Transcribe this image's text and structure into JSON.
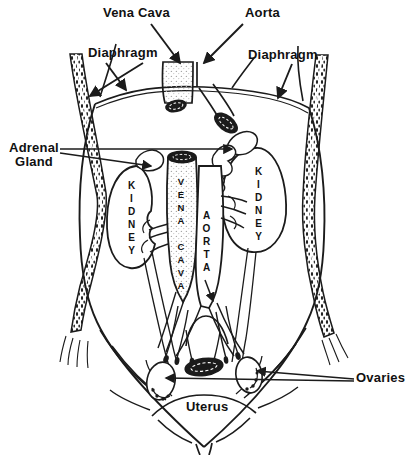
{
  "labels": {
    "vena_cava": "Vena Cava",
    "aorta": "Aorta",
    "diaphragm_left": "Diaphragm",
    "diaphragm_right": "Diaphragm",
    "adrenal_gland": "Adrenal Gland",
    "ovaries": "Ovaries",
    "uterus": "Uterus",
    "kidney_left": "KIDNEY",
    "kidney_right": "KIDNEY",
    "vena_cava_vessel": "VENA CAVA",
    "aorta_vessel": "AORTA"
  },
  "colors": {
    "ink": "#1b1b1b",
    "paper": "#ffffff",
    "stipple_light": "#a8a8a8",
    "speckle_dark": "#222222"
  }
}
